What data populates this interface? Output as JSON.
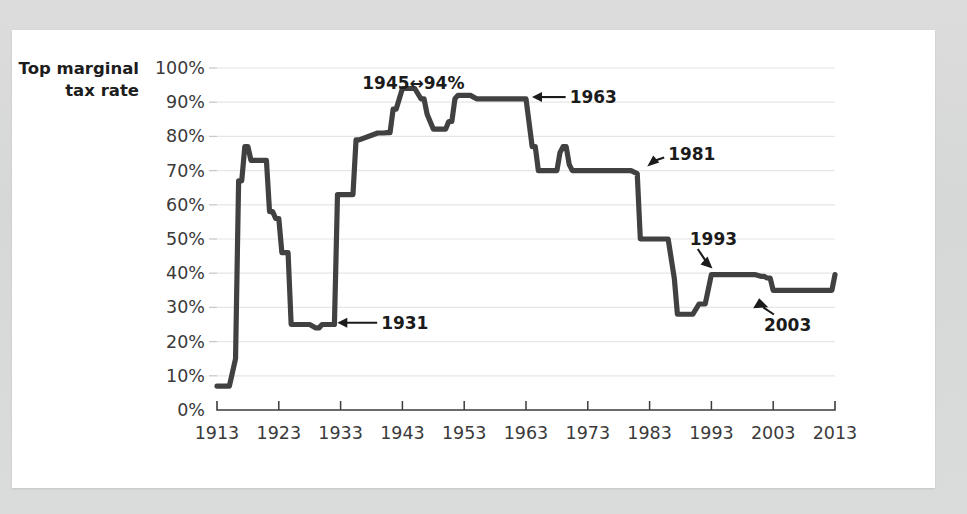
{
  "chart_data": {
    "type": "line",
    "title": "",
    "subtitle": "",
    "ylabel_line1": "Top marginal",
    "ylabel_line2": "tax rate",
    "xlabel": "",
    "xlim": [
      1913,
      2013
    ],
    "ylim": [
      0,
      100
    ],
    "grid": true,
    "legend": "none",
    "line_color": "#414141",
    "grid_color": "#e6e6e6",
    "axis_color": "#3c3c3c",
    "background_color": "#ffffff",
    "y_ticks": [
      "0%",
      "10%",
      "20%",
      "30%",
      "40%",
      "50%",
      "60%",
      "70%",
      "80%",
      "90%",
      "100%"
    ],
    "y_tick_values": [
      0,
      10,
      20,
      30,
      40,
      50,
      60,
      70,
      80,
      90,
      100
    ],
    "x_ticks": [
      "1913",
      "1923",
      "1933",
      "1943",
      "1953",
      "1963",
      "1973",
      "1983",
      "1993",
      "2003",
      "2013"
    ],
    "x_tick_values": [
      1913,
      1923,
      1933,
      1943,
      1953,
      1963,
      1973,
      1983,
      1993,
      2003,
      2013
    ],
    "series": [
      {
        "name": "Top marginal tax rate",
        "x": [
          1913,
          1915,
          1916,
          1916.5,
          1917,
          1917.5,
          1918,
          1918.5,
          1919,
          1921,
          1921.5,
          1922,
          1922.5,
          1923,
          1923.5,
          1924,
          1924.5,
          1925,
          1928,
          1929,
          1929.5,
          1930,
          1931,
          1932,
          1932.5,
          1933,
          1934,
          1935,
          1935.5,
          1936,
          1939,
          1940,
          1940.5,
          1941,
          1941.5,
          1942,
          1943,
          1944,
          1944.5,
          1945,
          1946,
          1946.5,
          1947,
          1948,
          1949,
          1950,
          1950.5,
          1951,
          1951.5,
          1952,
          1953,
          1954,
          1955,
          1963,
          1964,
          1964.5,
          1965,
          1967,
          1968,
          1968.5,
          1969,
          1969.5,
          1970,
          1970.5,
          1971,
          1980,
          1981,
          1981.5,
          1982,
          1986,
          1987,
          1987.5,
          1988,
          1990,
          1991,
          1991.5,
          1992,
          1993,
          1993.5,
          1994,
          2000,
          2001,
          2001.5,
          2002,
          2002.5,
          2003,
          2012,
          2012.5,
          2013
        ],
        "y": [
          7,
          7,
          15,
          67,
          67,
          77,
          77,
          73,
          73,
          73,
          58,
          58,
          56,
          56,
          46,
          46,
          46,
          25,
          25,
          24,
          24,
          25,
          25,
          25,
          63,
          63,
          63,
          63,
          79,
          79,
          81,
          81,
          81.1,
          81.1,
          88,
          88,
          94,
          94,
          94,
          94,
          91,
          91,
          86.45,
          82.13,
          82.13,
          82.13,
          84.36,
          84.36,
          91,
          92,
          92,
          92,
          91,
          91,
          77,
          77,
          70,
          70,
          70,
          75.25,
          77,
          77,
          71.75,
          70,
          70,
          70,
          69.125,
          50,
          50,
          50,
          38.5,
          28,
          28,
          28,
          31,
          31,
          31,
          39.6,
          39.6,
          39.6,
          39.6,
          39.1,
          39.1,
          38.6,
          38.6,
          35,
          35,
          35,
          39.6
        ],
        "description": "U.S. top marginal federal income tax rate, 1913-2013"
      }
    ],
    "annotations": [
      {
        "id": "a1945",
        "label": "1945↔94%",
        "x": 1945,
        "y": 94,
        "text_x": 1936.5,
        "text_y": 95.5,
        "arrow": "none"
      },
      {
        "id": "a1963",
        "label": "1963",
        "x": 1963,
        "y": 91,
        "text_x": 1966.5,
        "text_y": 91.5,
        "arrow": "left"
      },
      {
        "id": "a1931",
        "label": "1931",
        "x": 1931.5,
        "y": 25,
        "text_x": 1936,
        "text_y": 25.5,
        "arrow": "left"
      },
      {
        "id": "a1981",
        "label": "1981",
        "x": 1981,
        "y": 70,
        "text_x": 1986,
        "text_y": 75,
        "arrow": "down-left"
      },
      {
        "id": "a1993",
        "label": "1993",
        "x": 1993.5,
        "y": 39.6,
        "text_x": 1989.5,
        "text_y": 50,
        "arrow": "down-right"
      },
      {
        "id": "a2003",
        "label": "2003",
        "x": 2003,
        "y": 35,
        "text_x": 2001.5,
        "text_y": 25,
        "arrow": "up-left"
      }
    ]
  }
}
